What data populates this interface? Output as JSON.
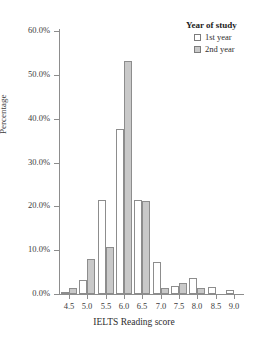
{
  "figure": {
    "cropped_title_fragment": "",
    "plot_background": "#ffffff",
    "axis_color": "#8d8d8d"
  },
  "legend": {
    "title": "Year of study",
    "position": "top-right",
    "entries": [
      {
        "label": "1st year",
        "color": "#ffffff",
        "swatch": "open-square-swatch"
      },
      {
        "label": "2nd year",
        "color": "#c9c9c9",
        "swatch": "filled-square-swatch"
      }
    ]
  },
  "chart_data": {
    "type": "bar",
    "title": "",
    "subtitle": "",
    "xlabel": "IELTS Reading score",
    "ylabel": "Percentage",
    "categories": [
      "4.5",
      "5.0",
      "5.5",
      "6.0",
      "6.5",
      "7.0",
      "7.5",
      "8.0",
      "8.5",
      "9.0"
    ],
    "series": [
      {
        "name": "1st year",
        "color": "#ffffff",
        "values": [
          0.5,
          3.2,
          21.5,
          37.7,
          21.5,
          7.3,
          1.9,
          3.6,
          1.5,
          1.0
        ]
      },
      {
        "name": "2nd year",
        "color": "#c9c9c9",
        "values": [
          1.4,
          8.0,
          10.7,
          53.2,
          21.2,
          1.3,
          2.5,
          1.3,
          0.0,
          0.0
        ]
      }
    ],
    "ylim": [
      0,
      60
    ],
    "yticks": [
      0,
      10,
      20,
      30,
      40,
      50,
      60
    ],
    "ytick_labels": [
      "0.0%",
      "10.0%",
      "20.0%",
      "30.0%",
      "40.0%",
      "50.0%",
      "60.0%"
    ],
    "xtick_labels": [
      "4.5",
      "5.0",
      "5.5",
      "6.0",
      "6.5",
      "7.0",
      "7.5",
      "8.0",
      "8.5",
      "9.0"
    ],
    "grid": false,
    "legend_position": "top-right",
    "value_unit": "%"
  }
}
